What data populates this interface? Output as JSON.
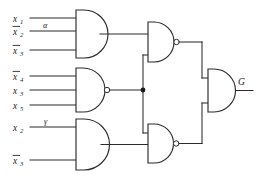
{
  "diagram": {
    "output_label": "G",
    "stroke_color": "#2b2b2b",
    "background_color": "#ffffff"
  },
  "inputs": {
    "gate_a": [
      {
        "base": "x",
        "sub": "1",
        "negated": false,
        "text": "x1"
      },
      {
        "base": "x",
        "sub": "2",
        "negated": true,
        "text": "x2"
      },
      {
        "base": "x",
        "sub": "3",
        "negated": true,
        "text": "x3"
      }
    ],
    "gate_b": [
      {
        "base": "x",
        "sub": "4",
        "negated": true,
        "text": "x4"
      },
      {
        "base": "x",
        "sub": "3",
        "negated": false,
        "text": "x3"
      },
      {
        "base": "x",
        "sub": "5",
        "negated": false,
        "text": "x5"
      }
    ],
    "gate_c": [
      {
        "base": "x",
        "sub": "2",
        "negated": false,
        "text": "x2"
      },
      {
        "base": "x",
        "sub": "3",
        "negated": true,
        "text": "x3"
      }
    ]
  },
  "wire_labels": {
    "alpha": "α",
    "gamma": "γ"
  },
  "gates": [
    {
      "id": "gate-a",
      "type": "AND",
      "inverted": false,
      "position": "top-left",
      "num_inputs": 3
    },
    {
      "id": "gate-b",
      "type": "NAND",
      "inverted": true,
      "position": "middle-left",
      "num_inputs": 3
    },
    {
      "id": "gate-c",
      "type": "AND",
      "inverted": false,
      "position": "bottom-left",
      "num_inputs": 2
    },
    {
      "id": "gate-d",
      "type": "NAND",
      "inverted": true,
      "position": "upper-right",
      "num_inputs": 2
    },
    {
      "id": "gate-e",
      "type": "NAND",
      "inverted": true,
      "position": "lower-right",
      "num_inputs": 2
    },
    {
      "id": "gate-f",
      "type": "AND",
      "inverted": false,
      "position": "output",
      "num_inputs": 2
    }
  ],
  "junctions": [
    {
      "id": "fanout-b",
      "x": 143,
      "y": 90
    }
  ]
}
